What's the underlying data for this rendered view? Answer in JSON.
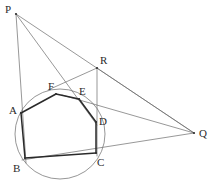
{
  "figure": {
    "width": 217,
    "height": 192,
    "background_color": "#ffffff",
    "stroke_color_thin": "#6b6b6b",
    "stroke_color_bold": "#2a2a2a",
    "circle_color": "#8a8a8a",
    "label_color": "#2b2b2b"
  },
  "points": {
    "P": {
      "label": "P",
      "x": 16,
      "y": 14,
      "label_x": 5,
      "label_y": 4
    },
    "R": {
      "label": "R",
      "x": 97,
      "y": 68,
      "label_x": 100,
      "label_y": 55
    },
    "Q": {
      "label": "Q",
      "x": 194,
      "y": 133,
      "label_x": 199,
      "label_y": 128
    },
    "A": {
      "label": "A",
      "x": 21,
      "y": 113,
      "label_x": 9,
      "label_y": 105
    },
    "B": {
      "label": "B",
      "x": 25,
      "y": 158,
      "label_x": 13,
      "label_y": 163
    },
    "C": {
      "label": "C",
      "x": 96,
      "y": 153,
      "label_x": 97,
      "label_y": 157
    },
    "D": {
      "label": "D",
      "x": 96,
      "y": 122,
      "label_x": 99,
      "label_y": 116
    },
    "E": {
      "label": "E",
      "x": 79,
      "y": 99,
      "label_x": 79,
      "label_y": 86
    },
    "F": {
      "label": "F",
      "x": 56,
      "y": 94,
      "label_x": 48,
      "label_y": 81
    }
  },
  "circle": {
    "name": "circumcircle",
    "cx": 60,
    "cy": 134,
    "r": 45,
    "stroke": "#8a8a8a",
    "stroke_width": 0.9
  },
  "hexagon": {
    "name": "hexagon-ABCDEF",
    "vertex_order": [
      "A",
      "B",
      "C",
      "D",
      "E",
      "F"
    ],
    "stroke": "#2a2a2a",
    "stroke_width": 1.5,
    "sides": [
      {
        "name": "side-AB",
        "from": "A",
        "to": "B"
      },
      {
        "name": "side-BC",
        "from": "B",
        "to": "C"
      },
      {
        "name": "side-CD",
        "from": "C",
        "to": "D"
      },
      {
        "name": "side-DE",
        "from": "D",
        "to": "E"
      },
      {
        "name": "side-EF",
        "from": "E",
        "to": "F"
      },
      {
        "name": "side-FA",
        "from": "F",
        "to": "A"
      }
    ]
  },
  "construction_lines": [
    {
      "name": "line-P-B",
      "x1": 16,
      "y1": 14,
      "x2": 26,
      "y2": 163
    },
    {
      "name": "line-P-D",
      "x1": 16,
      "y1": 14,
      "x2": 97,
      "y2": 125
    },
    {
      "name": "line-P-Q",
      "x1": 16,
      "y1": 14,
      "x2": 194,
      "y2": 133
    },
    {
      "name": "line-R-C",
      "x1": 97,
      "y1": 68,
      "x2": 97,
      "y2": 156
    },
    {
      "name": "line-R-F",
      "x1": 97,
      "y1": 68,
      "x2": 48,
      "y2": 90
    },
    {
      "name": "line-R-Q",
      "x1": 97,
      "y1": 68,
      "x2": 194,
      "y2": 133
    },
    {
      "name": "line-Q-E",
      "x1": 194,
      "y1": 133,
      "x2": 62,
      "y2": 95
    },
    {
      "name": "line-Q-B",
      "x1": 194,
      "y1": 133,
      "x2": 22,
      "y2": 160
    }
  ],
  "labels_list": [
    "P",
    "R",
    "Q",
    "A",
    "B",
    "C",
    "D",
    "E",
    "F"
  ]
}
